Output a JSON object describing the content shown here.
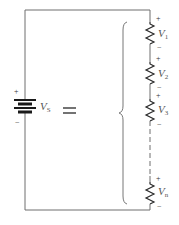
{
  "diagram": {
    "type": "series-circuit-equivalence",
    "source": {
      "symbol": "V",
      "subscript": "S",
      "positive_sign": "+",
      "negative_sign": "−"
    },
    "equals_symbol": "=",
    "resistors": [
      {
        "symbol": "V",
        "subscript": "1",
        "positive_sign": "+",
        "negative_sign": "−"
      },
      {
        "symbol": "V",
        "subscript": "2",
        "positive_sign": "+",
        "negative_sign": "−"
      },
      {
        "symbol": "V",
        "subscript": "3",
        "positive_sign": "+",
        "negative_sign": "−"
      },
      {
        "symbol": "V",
        "subscript": "n",
        "positive_sign": "+",
        "negative_sign": "−"
      }
    ],
    "colors": {
      "wire": "#6e6e6e",
      "component": "#2a2a2a",
      "text": "#555555"
    }
  }
}
